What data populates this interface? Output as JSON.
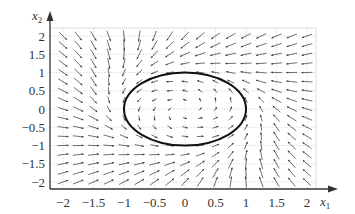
{
  "diagram": {
    "type": "phase_portrait_vector_field",
    "x_axis": {
      "label": "x",
      "subscript": "1",
      "ticks": [
        -2,
        -1.5,
        -1,
        -0.5,
        0,
        0.5,
        1,
        1.5,
        2
      ],
      "tick_labels": [
        "−2",
        "−1.5",
        "−1",
        "−0.5",
        "0",
        "0.5",
        "1",
        "1.5",
        "2"
      ],
      "range": [
        -2.2,
        2.2
      ]
    },
    "y_axis": {
      "label": "x",
      "subscript": "2",
      "ticks": [
        -2,
        -1.5,
        -1,
        -0.5,
        0,
        0.5,
        1,
        1.5,
        2
      ],
      "tick_labels": [
        "−2",
        "−1.5",
        "−1",
        "−0.5",
        "0",
        "0.5",
        "1",
        "1.5",
        "2"
      ],
      "range": [
        -2.2,
        2.2
      ]
    },
    "grid": true,
    "limit_cycle": {
      "shape": "ellipse",
      "center": [
        0,
        0
      ],
      "semi_axes": [
        1,
        1
      ],
      "color": "#111111"
    },
    "vector_field": {
      "grid_step": 0.25,
      "x_start": -2,
      "x_end": 2.0,
      "y_start": -2,
      "y_end": 2.0,
      "direction": "counter-clockwise, attracting limit cycle",
      "arrow_color": "#333333"
    },
    "colors": {
      "grid": "#cfcfcf",
      "axis": "#333333",
      "background": "#ffffff"
    }
  }
}
